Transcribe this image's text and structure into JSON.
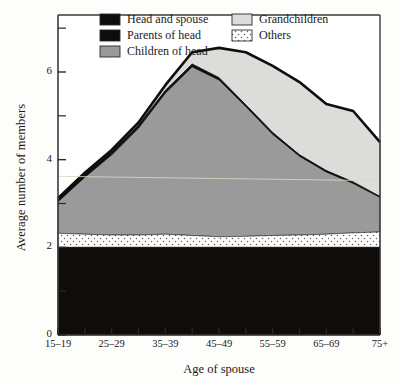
{
  "chart_data": {
    "type": "area",
    "title": "",
    "xlabel": "Age of spouse",
    "ylabel": "Average number of members",
    "categories": [
      "15–19",
      "20–24",
      "25–29",
      "30–34",
      "35–39",
      "40–44",
      "45–49",
      "50–54",
      "55–59",
      "60–64",
      "65–69",
      "70–74",
      "75+"
    ],
    "x_tick_labels": [
      "15–19",
      "25–29",
      "35–39",
      "45–49",
      "55–59",
      "65–69",
      "75+"
    ],
    "y_tick_labels": [
      "0",
      "2",
      "4",
      "6"
    ],
    "y_ticks_major": [
      0,
      2,
      4,
      6
    ],
    "y_ticks_minor": [
      1,
      3,
      5,
      7
    ],
    "ylim": [
      0,
      7.3
    ],
    "grid": false,
    "legend_position": "top-inside",
    "stacked": true,
    "stack_order_bottom_to_top": [
      "Head and spouse",
      "Others",
      "Children of head",
      "Parents of head",
      "Grandchildren"
    ],
    "series": [
      {
        "name": "Head and spouse",
        "color": "#100c0a",
        "values": [
          2.0,
          2.0,
          2.0,
          2.0,
          2.0,
          2.0,
          2.0,
          2.0,
          2.0,
          2.0,
          2.0,
          2.0,
          2.0
        ]
      },
      {
        "name": "Others",
        "color": "#ffffff",
        "pattern": "dots",
        "values": [
          0.32,
          0.3,
          0.28,
          0.28,
          0.3,
          0.27,
          0.24,
          0.25,
          0.27,
          0.28,
          0.3,
          0.33,
          0.35
        ]
      },
      {
        "name": "Children of head",
        "color": "#9a9a9a",
        "values": [
          0.72,
          1.3,
          1.83,
          2.44,
          3.22,
          3.85,
          3.58,
          2.96,
          2.31,
          1.8,
          1.42,
          1.13,
          0.79
        ]
      },
      {
        "name": "Parents of head",
        "color": "#100c0a",
        "values": [
          0.08,
          0.08,
          0.07,
          0.07,
          0.06,
          0.06,
          0.05,
          0.04,
          0.04,
          0.03,
          0.03,
          0.03,
          0.02
        ]
      },
      {
        "name": "Grandchildren",
        "color": "#dcdcda",
        "values": [
          0.0,
          0.02,
          0.04,
          0.06,
          0.12,
          0.27,
          0.68,
          1.2,
          1.52,
          1.66,
          1.52,
          1.62,
          1.24
        ]
      }
    ],
    "cumulative_top_line": [
      3.12,
      3.7,
      4.22,
      4.85,
      5.7,
      6.45,
      6.55,
      6.45,
      6.14,
      5.77,
      5.27,
      5.11,
      4.4
    ]
  },
  "legend": {
    "items": [
      {
        "label": "Head and spouse",
        "swatch": "black",
        "column": 0
      },
      {
        "label": "Parents of head",
        "swatch": "black",
        "column": 0
      },
      {
        "label": "Children of head",
        "swatch": "gray",
        "column": 0
      },
      {
        "label": "Grandchildren",
        "swatch": "lightgray",
        "column": 1
      },
      {
        "label": "Others",
        "swatch": "dotted",
        "column": 1
      }
    ]
  },
  "colors": {
    "head_and_spouse": "#100c0a",
    "parents_of_head": "#100c0a",
    "children_of_head": "#9a9a9a",
    "grandchildren": "#dcdcda",
    "others": "#ffffff",
    "frame": "#3a3a3a",
    "background": "#fdfdfb"
  }
}
